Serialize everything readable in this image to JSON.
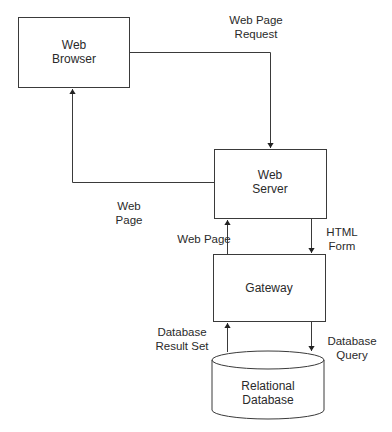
{
  "diagram": {
    "nodes": {
      "web_browser": {
        "line1": "Web",
        "line2": "Browser"
      },
      "web_server": {
        "line1": "Web",
        "line2": "Server"
      },
      "gateway": {
        "label": "Gateway"
      },
      "database": {
        "line1": "Relational",
        "line2": "Database"
      }
    },
    "edges": {
      "web_page_request": {
        "line1": "Web Page",
        "line2": "Request"
      },
      "web_page_return": {
        "line1": "Web",
        "line2": "Page"
      },
      "web_page_gateway": {
        "label": "Web Page"
      },
      "html_form": {
        "line1": "HTML",
        "line2": "Form"
      },
      "db_result_set": {
        "line1": "Database",
        "line2": "Result Set"
      },
      "db_query": {
        "line1": "Database",
        "line2": "Query"
      }
    },
    "colors": {
      "stroke": "#3a3a3a",
      "text": "#2a2a2a",
      "background": "#ffffff"
    }
  }
}
